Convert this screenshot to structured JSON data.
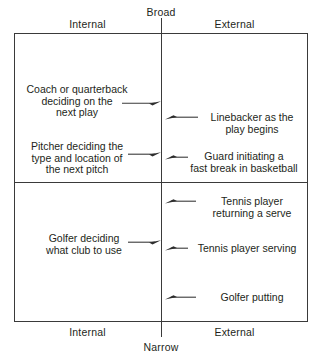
{
  "diagram": {
    "axes": {
      "top_label": "Broad",
      "bottom_label": "Narrow",
      "left_label_top": "Internal",
      "right_label_top": "External",
      "left_label_bottom": "Internal",
      "right_label_bottom": "External"
    },
    "line_color": "#3a3a3a",
    "text_color": "#231f20",
    "background": "#ffffff",
    "items": [
      {
        "id": "coach-quarterback",
        "quadrant": "broad-internal",
        "text": "Coach or quarterback\ndeciding on the\nnext play",
        "arrow_direction": "right"
      },
      {
        "id": "pitcher",
        "quadrant": "broad-internal",
        "text": "Pitcher deciding the\ntype and location of\nthe next pitch",
        "arrow_direction": "right"
      },
      {
        "id": "golfer-club",
        "quadrant": "narrow-internal",
        "text": "Golfer deciding\nwhat club to use",
        "arrow_direction": "right"
      },
      {
        "id": "linebacker",
        "quadrant": "broad-external",
        "text": "Linebacker as the\nplay begins",
        "arrow_direction": "left"
      },
      {
        "id": "guard-fast-break",
        "quadrant": "broad-external",
        "text": "Guard initiating a\nfast break in basketball",
        "arrow_direction": "left"
      },
      {
        "id": "tennis-returning",
        "quadrant": "narrow-external",
        "text": "Tennis player\nreturning a serve",
        "arrow_direction": "left"
      },
      {
        "id": "tennis-serving",
        "quadrant": "narrow-external",
        "text": "Tennis player serving",
        "arrow_direction": "left"
      },
      {
        "id": "golfer-putting",
        "quadrant": "narrow-external",
        "text": "Golfer putting",
        "arrow_direction": "left"
      }
    ]
  }
}
